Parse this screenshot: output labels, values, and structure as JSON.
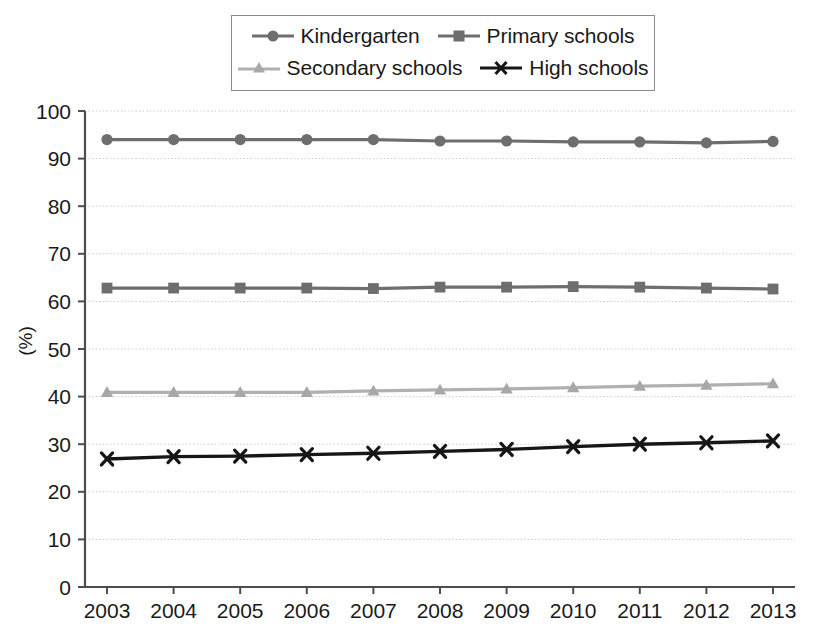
{
  "chart_data": {
    "type": "line",
    "title": "",
    "xlabel": "",
    "ylabel": "(%)",
    "categories": [
      "2003",
      "2004",
      "2005",
      "2006",
      "2007",
      "2008",
      "2009",
      "2010",
      "2011",
      "2012",
      "2013"
    ],
    "ylim": [
      0,
      100
    ],
    "y_ticks": [
      "0",
      "10",
      "20",
      "30",
      "40",
      "50",
      "60",
      "70",
      "80",
      "90",
      "100"
    ],
    "grid": true,
    "legend_position": "top-center",
    "series": [
      {
        "name": "Kindergarten",
        "marker": "circle",
        "color": "#6e6e6e",
        "values": [
          94.0,
          94.0,
          94.0,
          94.0,
          94.0,
          93.7,
          93.7,
          93.5,
          93.5,
          93.3,
          93.6
        ]
      },
      {
        "name": "Primary schools",
        "marker": "square",
        "color": "#6e6e6e",
        "values": [
          62.8,
          62.8,
          62.8,
          62.8,
          62.7,
          63.0,
          63.0,
          63.1,
          63.0,
          62.8,
          62.6
        ]
      },
      {
        "name": "Secondary schools",
        "marker": "triangle",
        "color": "#b0b0b0",
        "values": [
          40.9,
          40.9,
          40.9,
          40.9,
          41.2,
          41.4,
          41.6,
          41.9,
          42.2,
          42.4,
          42.7
        ]
      },
      {
        "name": "High schools",
        "marker": "cross",
        "color": "#161616",
        "values": [
          26.9,
          27.4,
          27.5,
          27.8,
          28.1,
          28.5,
          28.9,
          29.5,
          30.0,
          30.3,
          30.7
        ]
      }
    ]
  },
  "legend": {
    "entries": [
      {
        "label": "Kindergarten"
      },
      {
        "label": "Primary schools"
      },
      {
        "label": "Secondary schools"
      },
      {
        "label": "High schools"
      }
    ]
  },
  "axes": {
    "y_unit_label": "(%)"
  }
}
